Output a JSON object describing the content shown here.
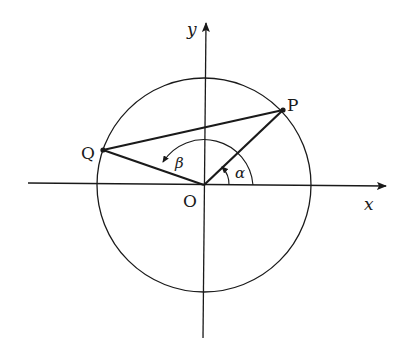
{
  "figure": {
    "type": "unit-circle-angle-diagram",
    "axes": {
      "x_label": "x",
      "y_label": "y",
      "origin_label": "O"
    },
    "points": [
      {
        "name": "P",
        "label": "P"
      },
      {
        "name": "Q",
        "label": "Q"
      }
    ],
    "angles": [
      {
        "name": "alpha",
        "label": "α",
        "from": "x-axis",
        "to": "OP"
      },
      {
        "name": "beta",
        "label": "β",
        "from": "x-axis",
        "to": "OQ"
      }
    ],
    "segments": [
      "OP",
      "OQ",
      "PQ"
    ],
    "colors": {
      "ink": "#1a1a1a",
      "background": "#ffffff"
    }
  }
}
